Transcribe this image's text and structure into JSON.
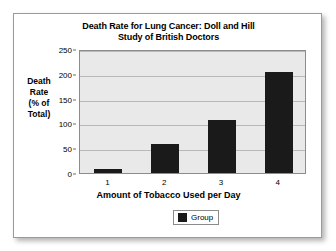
{
  "chart_data": {
    "type": "bar",
    "title": "Death Rate for Lung Cancer: Doll and Hill Study of British Doctors",
    "title_lines": [
      "Death Rate for Lung Cancer: Doll and Hill",
      "Study of British Doctors"
    ],
    "categories": [
      "1",
      "2",
      "3",
      "4"
    ],
    "values": [
      8,
      58,
      106,
      203
    ],
    "series": [
      {
        "name": "Group",
        "values": [
          8,
          58,
          106,
          203
        ]
      }
    ],
    "xlabel": "Amount of Tobacco Used per Day",
    "ylabel": "Death Rate (% of Total)",
    "ylabel_lines": [
      "Death",
      "Rate",
      "(% of",
      "Total)"
    ],
    "ylim": [
      0,
      250
    ],
    "yticks": [
      0,
      50,
      100,
      150,
      200,
      250
    ],
    "ytick_labels": [
      "0",
      "50",
      "100",
      "150",
      "200",
      "250"
    ],
    "xtick_labels": [
      "1",
      "2",
      "3",
      "4"
    ],
    "grid": true,
    "legend": {
      "position": "bottom-center",
      "entries": [
        {
          "label": "Group",
          "color": "#1a1a1a"
        }
      ]
    },
    "colors": {
      "bar": "#1a1a1a",
      "plot_background": "#e9e9e9",
      "gridline": "#b9b9b9",
      "axis": "#8c8c8c",
      "text": "#000000",
      "card_background": "#ffffff",
      "card_border": "#9a9a9a"
    }
  }
}
